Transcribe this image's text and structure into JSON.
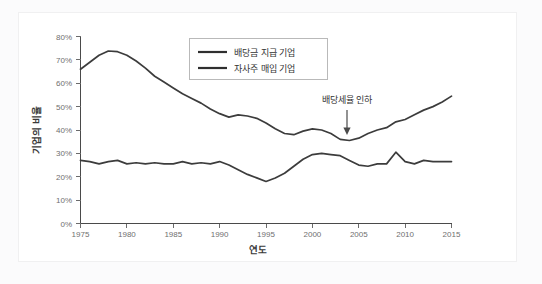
{
  "chart_data": {
    "type": "line",
    "title": "",
    "xlabel": "연도",
    "ylabel": "기업의 비율",
    "xlim": [
      1975,
      2015
    ],
    "ylim": [
      0,
      80
    ],
    "grid": false,
    "legend_position": "top-center",
    "x_ticks": [
      "1975",
      "1980",
      "1985",
      "1990",
      "1995",
      "2000",
      "2005",
      "2010",
      "2015"
    ],
    "x_tick_values": [
      1975,
      1980,
      1985,
      1990,
      1995,
      2000,
      2005,
      2010,
      2015
    ],
    "y_ticks": [
      "0%",
      "10%",
      "20%",
      "30%",
      "40%",
      "50%",
      "60%",
      "70%",
      "80%"
    ],
    "y_tick_values": [
      0,
      10,
      20,
      30,
      40,
      50,
      60,
      70,
      80
    ],
    "x": [
      1975,
      1976,
      1977,
      1978,
      1979,
      1980,
      1981,
      1982,
      1983,
      1984,
      1985,
      1986,
      1987,
      1988,
      1989,
      1990,
      1991,
      1992,
      1993,
      1994,
      1995,
      1996,
      1997,
      1998,
      1999,
      2000,
      2001,
      2002,
      2003,
      2004,
      2005,
      2006,
      2007,
      2008,
      2009,
      2010,
      2011,
      2012,
      2013,
      2014,
      2015
    ],
    "series": [
      {
        "name": "배당금 지급 기업",
        "color": "#3c3c3c",
        "values": [
          66.0,
          69.0,
          72.0,
          73.8,
          73.5,
          72.0,
          69.5,
          66.5,
          63.0,
          60.5,
          58.0,
          55.5,
          53.5,
          51.5,
          49.0,
          47.0,
          45.5,
          46.5,
          46.0,
          45.0,
          43.0,
          40.5,
          38.5,
          38.0,
          39.5,
          40.5,
          40.0,
          38.5,
          36.0,
          35.5,
          36.5,
          38.5,
          40.0,
          41.0,
          43.5,
          44.5,
          46.5,
          48.5,
          50.0,
          52.0,
          54.5
        ]
      },
      {
        "name": "자사주 매입 기업",
        "color": "#3c3c3c",
        "values": [
          27.0,
          26.5,
          25.5,
          26.5,
          27.0,
          25.5,
          26.0,
          25.5,
          26.0,
          25.5,
          25.5,
          26.5,
          25.5,
          26.0,
          25.5,
          26.5,
          25.0,
          23.0,
          21.0,
          19.5,
          18.0,
          19.5,
          21.5,
          24.5,
          27.5,
          29.5,
          30.0,
          29.5,
          29.0,
          27.0,
          25.0,
          24.5,
          25.5,
          25.5,
          30.5,
          26.5,
          25.5,
          27.0,
          26.5,
          26.5,
          26.5
        ]
      }
    ],
    "annotations": [
      {
        "text": "배당세율 인하",
        "x_value": 2002,
        "y_value": 36,
        "arrow": "down"
      }
    ]
  },
  "legend": {
    "items": [
      {
        "label": "배당금 지급 기업"
      },
      {
        "label": "자사주 매입 기업"
      }
    ]
  },
  "axes": {
    "y_title": "기업의 비율",
    "x_title": "연도"
  },
  "colors": {
    "line": "#3c3c3c",
    "axis": "#4a4a4a",
    "tick_text": "#6f6f6f",
    "card_background": "#ffffff",
    "page_background": "#fbfbfc"
  }
}
